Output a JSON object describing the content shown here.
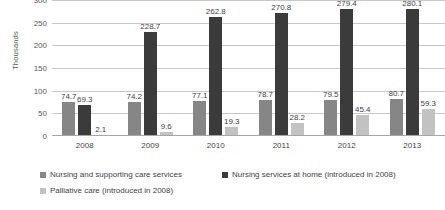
{
  "chart_data": {
    "type": "bar",
    "title": "",
    "xlabel": "",
    "ylabel": "Thousands",
    "ylim": [
      0,
      300
    ],
    "yticks": [
      0,
      50,
      100,
      150,
      200,
      250,
      300
    ],
    "grid": true,
    "legend_position": "bottom-left",
    "categories": [
      "2008",
      "2009",
      "2010",
      "2011",
      "2012",
      "2013"
    ],
    "series": [
      {
        "name": "Nursing and supporting care services",
        "color": "#868686",
        "values": [
          74.7,
          74.2,
          77.1,
          78.7,
          79.5,
          80.7
        ]
      },
      {
        "name": "Nursing services at home (introduced in 2008)",
        "color": "#3b3b3b",
        "values": [
          69.3,
          228.7,
          262.8,
          270.8,
          279.4,
          280.1
        ]
      },
      {
        "name": "Palliative care (introduced in 2008)",
        "color": "#c2c2c2",
        "values": [
          2.1,
          9.6,
          19.3,
          28.2,
          45.4,
          59.3
        ]
      }
    ]
  }
}
